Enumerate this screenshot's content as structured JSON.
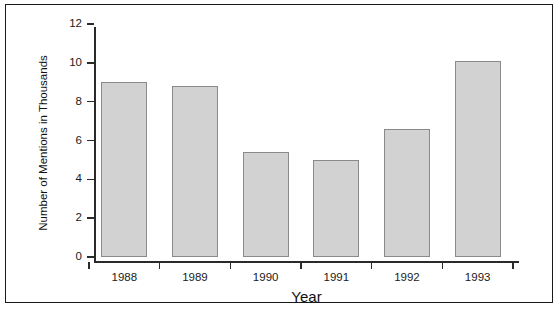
{
  "figure": {
    "frame_color": "#1a1a1a",
    "background": "#ffffff"
  },
  "chart_data": {
    "type": "bar",
    "title": "",
    "subtitle": "",
    "categories": [
      "1988",
      "1989",
      "1990",
      "1991",
      "1992",
      "1993"
    ],
    "values": [
      9.0,
      8.8,
      5.4,
      5.0,
      6.6,
      10.1
    ],
    "series": [
      {
        "name": "Number of Mentions in Thousands",
        "values": [
          9.0,
          8.8,
          5.4,
          5.0,
          6.6,
          10.1
        ]
      }
    ],
    "xlabel": "Year",
    "ylabel": "Number of Mentions in Thousands",
    "ylim": [
      0,
      12
    ],
    "yticks": [
      0,
      2,
      4,
      6,
      8,
      10,
      12
    ],
    "ytick_labels": [
      "0",
      "2",
      "4",
      "6",
      "8",
      "10",
      "12"
    ],
    "xtick_labels": [
      "1988",
      "1989",
      "1990",
      "1991",
      "1992",
      "1993"
    ],
    "grid": false,
    "legend": false,
    "legend_position": "none",
    "bar_fill_color": "#d2d2d2",
    "bar_edge_color": "#8a8a8a",
    "axis_color": "#2a2a2a"
  }
}
